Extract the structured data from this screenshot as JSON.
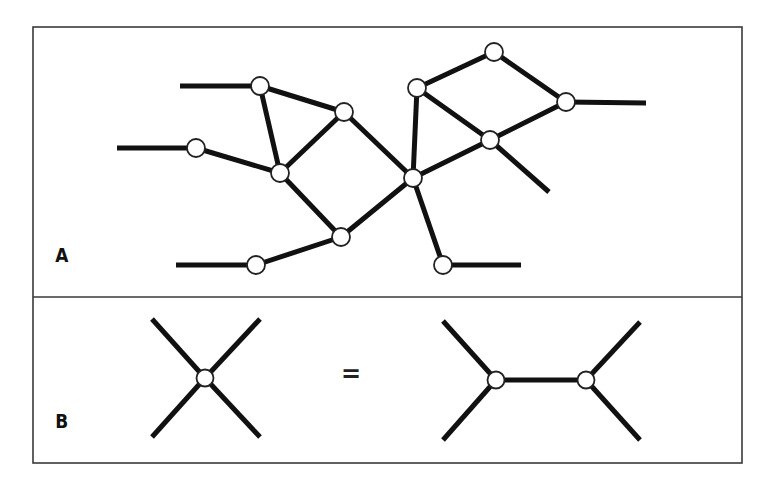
{
  "figure": {
    "frame": {
      "x": 33,
      "y": 27,
      "width": 709,
      "height": 436,
      "divider_y": 297
    },
    "panels": [
      {
        "id": "A",
        "label": "A",
        "label_pos": [
          54,
          245
        ]
      },
      {
        "id": "B",
        "label": "B",
        "label_pos": [
          54,
          411
        ]
      }
    ],
    "equals_sign": {
      "text": "=",
      "pos": [
        341,
        362
      ]
    },
    "colors": {
      "edge": "#111111",
      "node_fill": "#ffffff",
      "node_stroke": "#222222",
      "frame": "#3a3a3a"
    }
  },
  "panel_a": {
    "nodes": [
      {
        "id": "n1",
        "x": 260,
        "y": 86
      },
      {
        "id": "n2",
        "x": 344,
        "y": 112
      },
      {
        "id": "n3",
        "x": 196,
        "y": 148
      },
      {
        "id": "n4",
        "x": 280,
        "y": 173
      },
      {
        "id": "n5",
        "x": 341,
        "y": 237
      },
      {
        "id": "n6",
        "x": 256,
        "y": 265
      },
      {
        "id": "n7",
        "x": 413,
        "y": 178
      },
      {
        "id": "n8",
        "x": 417,
        "y": 88
      },
      {
        "id": "n9",
        "x": 494,
        "y": 52
      },
      {
        "id": "n10",
        "x": 566,
        "y": 102
      },
      {
        "id": "n11",
        "x": 490,
        "y": 140
      },
      {
        "id": "n12",
        "x": 443,
        "y": 265
      }
    ],
    "edges": [
      [
        [
          180,
          86
        ],
        [
          260,
          86
        ]
      ],
      [
        [
          117,
          148
        ],
        [
          196,
          148
        ]
      ],
      [
        [
          176,
          265
        ],
        [
          256,
          265
        ]
      ],
      [
        [
          260,
          86
        ],
        [
          344,
          112
        ]
      ],
      [
        [
          260,
          86
        ],
        [
          280,
          173
        ]
      ],
      [
        [
          196,
          148
        ],
        [
          280,
          173
        ]
      ],
      [
        [
          280,
          173
        ],
        [
          344,
          112
        ]
      ],
      [
        [
          280,
          173
        ],
        [
          341,
          237
        ]
      ],
      [
        [
          344,
          112
        ],
        [
          413,
          178
        ]
      ],
      [
        [
          341,
          237
        ],
        [
          413,
          178
        ]
      ],
      [
        [
          256,
          265
        ],
        [
          341,
          237
        ]
      ],
      [
        [
          413,
          178
        ],
        [
          417,
          88
        ]
      ],
      [
        [
          413,
          178
        ],
        [
          490,
          140
        ]
      ],
      [
        [
          413,
          178
        ],
        [
          443,
          265
        ]
      ],
      [
        [
          443,
          265
        ],
        [
          521,
          265
        ]
      ],
      [
        [
          417,
          88
        ],
        [
          494,
          52
        ]
      ],
      [
        [
          417,
          88
        ],
        [
          490,
          140
        ]
      ],
      [
        [
          494,
          52
        ],
        [
          566,
          102
        ]
      ],
      [
        [
          490,
          140
        ],
        [
          566,
          102
        ]
      ],
      [
        [
          566,
          102
        ],
        [
          646,
          103
        ]
      ],
      [
        [
          490,
          140
        ],
        [
          549,
          192
        ]
      ]
    ],
    "node_radius": 9
  },
  "panel_b": {
    "left": {
      "node": {
        "x": 205,
        "y": 378
      },
      "edges": [
        [
          [
            152,
            319
          ],
          [
            205,
            378
          ]
        ],
        [
          [
            260,
            319
          ],
          [
            205,
            378
          ]
        ],
        [
          [
            152,
            437
          ],
          [
            205,
            378
          ]
        ],
        [
          [
            260,
            437
          ],
          [
            205,
            378
          ]
        ]
      ]
    },
    "right": {
      "nodes": [
        {
          "x": 496,
          "y": 380
        },
        {
          "x": 586,
          "y": 380
        }
      ],
      "edges": [
        [
          [
            443,
            321
          ],
          [
            496,
            380
          ]
        ],
        [
          [
            443,
            440
          ],
          [
            496,
            380
          ]
        ],
        [
          [
            496,
            380
          ],
          [
            586,
            380
          ]
        ],
        [
          [
            640,
            322
          ],
          [
            586,
            380
          ]
        ],
        [
          [
            640,
            440
          ],
          [
            586,
            380
          ]
        ]
      ]
    },
    "node_radius": 8.5
  }
}
